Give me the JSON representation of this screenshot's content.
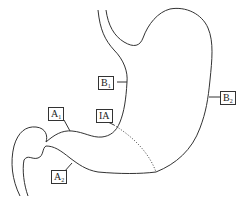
{
  "diagram": {
    "stroke_color": "#333333",
    "labels": [
      {
        "id": "B1",
        "main": "B",
        "sub": "1"
      },
      {
        "id": "B2",
        "main": "B",
        "sub": "2"
      },
      {
        "id": "A1",
        "main": "A",
        "sub": "1"
      },
      {
        "id": "A2",
        "main": "A",
        "sub": "2"
      },
      {
        "id": "IA",
        "main": "IA",
        "sub": ""
      }
    ]
  }
}
